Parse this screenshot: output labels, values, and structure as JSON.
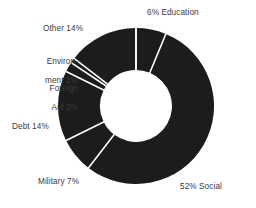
{
  "chart_data": {
    "type": "pie",
    "variant": "donut",
    "title": "",
    "subtitle": "",
    "xlabel": "",
    "ylabel": "",
    "grid": false,
    "legend_position": "none",
    "units": "percent",
    "start_angle_deg": 0,
    "direction": "clockwise",
    "center": {
      "x": 136,
      "y": 106
    },
    "outer_radius": 78,
    "inner_radius": 36,
    "slice_fill": "#1c1c1c",
    "separator_color": "#ffffff",
    "background": "#ffffff",
    "text_color": "#3b3b3b",
    "categories": [
      "Education",
      "Social",
      "Military",
      "Debt",
      "Foreign Aid",
      "Environment",
      "Other"
    ],
    "values": [
      6,
      52,
      7,
      14,
      2,
      1,
      14
    ],
    "labels": [
      "6% Education",
      "52% Social",
      "Military 7%",
      "Debt 14%",
      "Foreign\nAid 2%",
      "Environ-\nment 1%",
      "Other 14%"
    ],
    "slices": [
      {
        "name": "Education",
        "value": 6,
        "label": "6% Education",
        "color": "#1c1c1c"
      },
      {
        "name": "Social",
        "value": 52,
        "label": "52% Social",
        "color": "#1c1c1c"
      },
      {
        "name": "Military",
        "value": 7,
        "label": "Military 7%",
        "color": "#1c1c1c"
      },
      {
        "name": "Debt",
        "value": 14,
        "label": "Debt 14%",
        "color": "#1c1c1c"
      },
      {
        "name": "Foreign Aid",
        "value": 2,
        "label": "Foreign\nAid 2%",
        "color": "#1c1c1c"
      },
      {
        "name": "Environment",
        "value": 1,
        "label": "Environ-\nment 1%",
        "color": "#1c1c1c"
      },
      {
        "name": "Other",
        "value": 14,
        "label": "Other 14%",
        "color": "#1c1c1c"
      }
    ]
  },
  "labels": {
    "education": "6% Education",
    "other": "Other 14%",
    "environment_line1": "Environ-",
    "environment_line2": "ment 1%",
    "foreign_aid_line1": "Foreign",
    "foreign_aid_line2": "Aid 2%",
    "debt": "Debt 14%",
    "military": "Military 7%",
    "social": "52% Social"
  }
}
